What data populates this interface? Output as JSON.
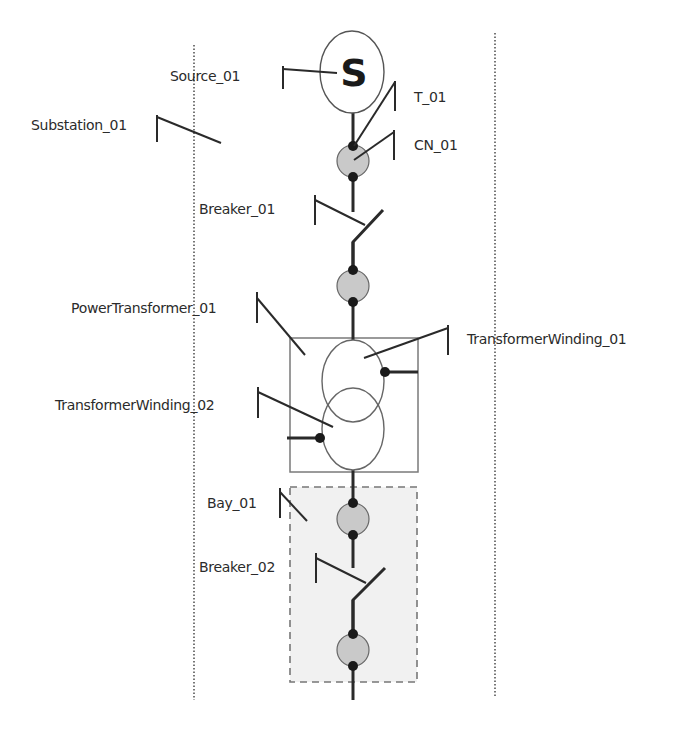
{
  "diagram": {
    "type": "single-line electrical network diagram",
    "colors": {
      "line": "#2a2a2a",
      "node_fill": "#c9c9c9",
      "bay_fill": "#f1f1f1",
      "box_stroke": "#7a7a7a",
      "dotted": "#555555"
    },
    "source": {
      "symbol": "S",
      "label": "Source_01"
    },
    "substation": {
      "label": "Substation_01"
    },
    "terminal": {
      "label": "T_01"
    },
    "connectivity_node": {
      "label": "CN_01"
    },
    "breaker_1": {
      "label": "Breaker_01"
    },
    "power_transformer": {
      "label": "PowerTransformer_01"
    },
    "winding_1": {
      "label": "TransformerWinding_01"
    },
    "winding_2": {
      "label": "TransformerWinding_02"
    },
    "bay": {
      "label": "Bay_01"
    },
    "breaker_2": {
      "label": "Breaker_02"
    }
  }
}
